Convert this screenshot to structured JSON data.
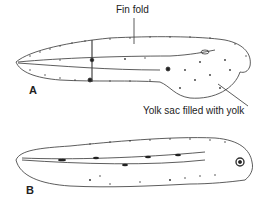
{
  "figure": {
    "panels": [
      {
        "id": "A",
        "label": "A",
        "annotations": [
          "Fin fold",
          "Yolk sac filled with yolk"
        ]
      },
      {
        "id": "B",
        "label": "B",
        "annotations": []
      }
    ],
    "labels": {
      "fin_fold": "Fin fold",
      "yolk_sac": "Yolk sac filled with yolk",
      "panel_a": "A",
      "panel_b": "B"
    }
  }
}
